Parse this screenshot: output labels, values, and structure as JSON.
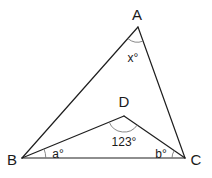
{
  "figure": {
    "type": "geometry-diagram",
    "vertices": [
      {
        "name": "A",
        "label": "A",
        "x": 138,
        "y": 27,
        "label_x": 137,
        "label_y": 20
      },
      {
        "name": "B",
        "label": "B",
        "x": 22,
        "y": 158,
        "label_x": 12,
        "label_y": 165
      },
      {
        "name": "C",
        "label": "C",
        "x": 185,
        "y": 158,
        "label_x": 196,
        "label_y": 165
      },
      {
        "name": "D",
        "label": "D",
        "x": 124,
        "y": 116,
        "label_x": 124,
        "label_y": 107
      }
    ],
    "segments": [
      {
        "from": "A",
        "to": "B"
      },
      {
        "from": "A",
        "to": "C"
      },
      {
        "from": "B",
        "to": "C"
      },
      {
        "from": "B",
        "to": "D"
      },
      {
        "from": "D",
        "to": "C"
      }
    ],
    "angles": [
      {
        "vertex": "A",
        "label": "x°",
        "between": [
          "B",
          "C"
        ],
        "label_x": 133,
        "label_y": 62
      },
      {
        "vertex": "D",
        "label": "123°",
        "between": [
          "B",
          "C"
        ],
        "label_x": 124,
        "label_y": 146
      },
      {
        "vertex": "B",
        "label": "a°",
        "between": [
          "D",
          "C"
        ],
        "label_x": 58,
        "label_y": 158
      },
      {
        "vertex": "C",
        "label": "b°",
        "between": [
          "B",
          "D"
        ],
        "label_x": 161,
        "label_y": 158
      }
    ],
    "colors": {
      "line": "#1e1e1e",
      "arc": "#7a7a7a",
      "text": "#1a1a1a",
      "background": "#ffffff"
    }
  }
}
